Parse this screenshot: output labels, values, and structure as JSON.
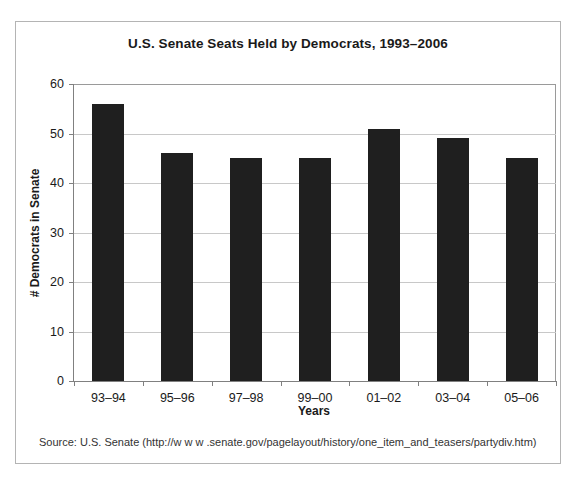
{
  "chart_data": {
    "type": "bar",
    "title": "U.S. Senate Seats Held by Democrats, 1993–2006",
    "xlabel": "Years",
    "ylabel": "# Democrats in Senate",
    "categories": [
      "93–94",
      "95–96",
      "97–98",
      "99–00",
      "01–02",
      "03–04",
      "05–06"
    ],
    "values": [
      56,
      46,
      45,
      45,
      51,
      49,
      45
    ],
    "ylim": [
      0,
      60
    ],
    "yticks": [
      0,
      10,
      20,
      30,
      40,
      50,
      60
    ],
    "ytick_labels": [
      "0",
      "10",
      "20",
      "30",
      "40",
      "50",
      "60"
    ],
    "grid": "horizontal",
    "legend": "none",
    "bar_color": "#1f1f1f",
    "gridline_color": "#c8c8c8",
    "axis_color": "#808080",
    "background_color": "#ffffff",
    "border_color": "#b4b4b4"
  },
  "notes": {
    "source": "Source: U.S. Senate (http://w w w .senate.gov/pagelayout/history/one_item_and_teasers/partydiv.htm)"
  }
}
